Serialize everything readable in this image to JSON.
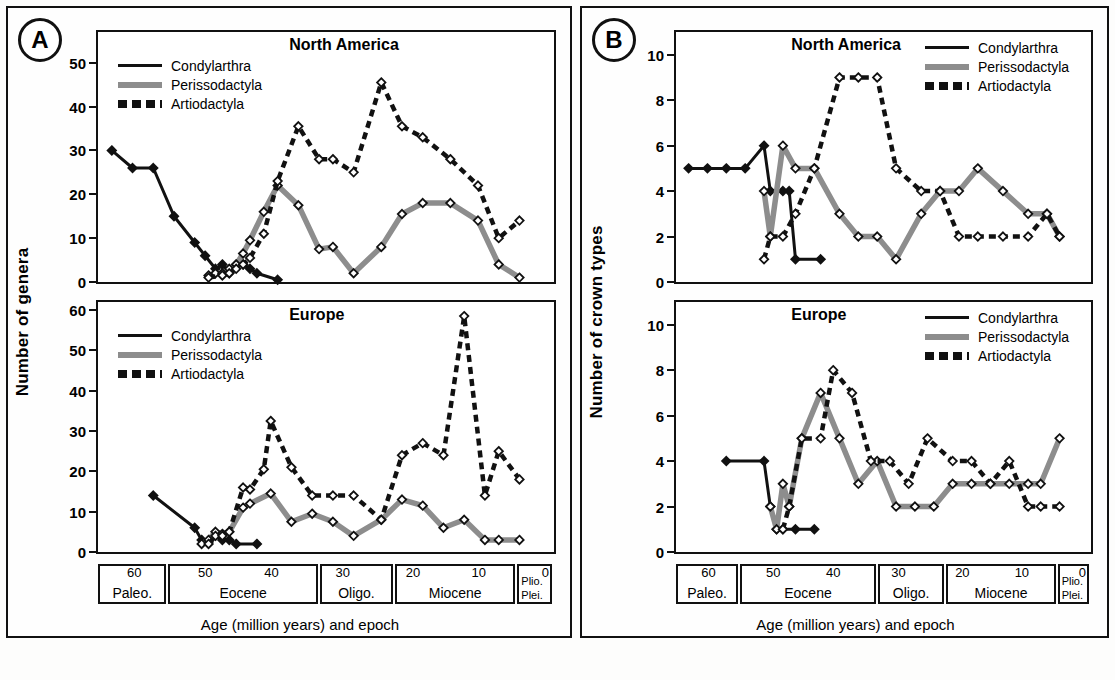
{
  "figure": {
    "panels": [
      {
        "id": "A",
        "badge": "A",
        "ylabel": "Number of genera",
        "xcaption": "Age (million years) and epoch"
      },
      {
        "id": "B",
        "badge": "B",
        "ylabel": "Number of crown types",
        "xcaption": "Age (million years) and epoch"
      }
    ],
    "epochs": [
      {
        "name": "Paleo.",
        "nums": [
          "60"
        ],
        "start": 66,
        "end": 55.8
      },
      {
        "name": "Eocene",
        "nums": [
          "50",
          "40"
        ],
        "start": 55.8,
        "end": 33.9
      },
      {
        "name": "Oligo.",
        "nums": [
          "30"
        ],
        "start": 33.9,
        "end": 23.0
      },
      {
        "name": "Miocene",
        "nums": [
          "20",
          "10"
        ],
        "start": 23.0,
        "end": 5.3
      },
      {
        "name": "Plio.",
        "name2": "Plei.",
        "nums": [
          "0"
        ],
        "start": 5.3,
        "end": 0
      }
    ],
    "legend": [
      {
        "key": "condylarthra",
        "label": "Condylarthra",
        "style": "solid",
        "color": "#111111"
      },
      {
        "key": "perissodactyla",
        "label": "Perissodactyla",
        "style": "gray",
        "color": "#8d8d8d"
      },
      {
        "key": "artiodactyla",
        "label": "Artiodactyla",
        "style": "dashed",
        "color": "#111111"
      }
    ]
  },
  "chart_data": [
    {
      "id": "A-north-america",
      "type": "line",
      "title": "North America",
      "xlabel": "Age (million years) and epoch",
      "ylabel": "Number of genera",
      "xlim": [
        66,
        0
      ],
      "ylim": [
        0,
        57
      ],
      "yticks": [
        0,
        10,
        20,
        30,
        40,
        50
      ],
      "grid": false,
      "legend_position": "top-left",
      "series": [
        {
          "name": "Condylarthra",
          "style": "solid",
          "color": "#111111",
          "marker": "filled-diamond",
          "points": [
            [
              64,
              30
            ],
            [
              61,
              26
            ],
            [
              58,
              26
            ],
            [
              55,
              15
            ],
            [
              52,
              9
            ],
            [
              50.5,
              6
            ],
            [
              49,
              3
            ],
            [
              48,
              4
            ],
            [
              47,
              2
            ],
            [
              46,
              4
            ],
            [
              45,
              4
            ],
            [
              44,
              3
            ],
            [
              43,
              2
            ],
            [
              40,
              0.5
            ]
          ]
        },
        {
          "name": "Perissodactyla",
          "style": "gray",
          "color": "#8d8d8d",
          "marker": "open-diamond",
          "points": [
            [
              50,
              1.5
            ],
            [
              49,
              2
            ],
            [
              48,
              2
            ],
            [
              47,
              3
            ],
            [
              46,
              4
            ],
            [
              45,
              6.5
            ],
            [
              44,
              9.5
            ],
            [
              42,
              16
            ],
            [
              40,
              22
            ],
            [
              37,
              17.5
            ],
            [
              34,
              7.5
            ],
            [
              32,
              8
            ],
            [
              29,
              2
            ],
            [
              25,
              8
            ],
            [
              22,
              15.5
            ],
            [
              19,
              18
            ],
            [
              15,
              18
            ],
            [
              11,
              14
            ],
            [
              8,
              4
            ],
            [
              5,
              1
            ]
          ]
        },
        {
          "name": "Artiodactyla",
          "style": "dashed",
          "color": "#111111",
          "marker": "open-diamond",
          "points": [
            [
              50,
              1
            ],
            [
              48,
              1.5
            ],
            [
              47,
              2
            ],
            [
              46,
              3
            ],
            [
              45,
              4
            ],
            [
              44,
              5.5
            ],
            [
              42,
              11
            ],
            [
              40,
              23
            ],
            [
              37,
              35.5
            ],
            [
              34,
              28
            ],
            [
              32,
              28
            ],
            [
              29,
              25
            ],
            [
              25,
              45.5
            ],
            [
              22,
              35.5
            ],
            [
              19,
              33
            ],
            [
              15,
              28
            ],
            [
              11,
              22
            ],
            [
              8,
              10
            ],
            [
              5,
              14
            ]
          ]
        }
      ]
    },
    {
      "id": "A-europe",
      "type": "line",
      "title": "Europe",
      "xlabel": "Age (million years) and epoch",
      "ylabel": "Number of genera",
      "xlim": [
        66,
        0
      ],
      "ylim": [
        0,
        62
      ],
      "yticks": [
        0,
        10,
        20,
        30,
        40,
        50,
        60
      ],
      "grid": false,
      "legend_position": "top-left",
      "series": [
        {
          "name": "Condylarthra",
          "style": "solid",
          "color": "#111111",
          "marker": "filled-diamond",
          "points": [
            [
              58,
              14
            ],
            [
              52,
              6
            ],
            [
              51,
              3
            ],
            [
              50,
              2.5
            ],
            [
              49,
              4
            ],
            [
              48,
              3
            ],
            [
              47,
              3
            ],
            [
              46,
              2
            ],
            [
              43,
              2
            ]
          ]
        },
        {
          "name": "Perissodactyla",
          "style": "gray",
          "color": "#8d8d8d",
          "marker": "open-diamond",
          "points": [
            [
              51,
              2
            ],
            [
              50,
              3
            ],
            [
              49,
              5
            ],
            [
              48,
              4.5
            ],
            [
              47,
              5
            ],
            [
              45,
              11
            ],
            [
              44,
              12
            ],
            [
              41,
              14.5
            ],
            [
              38,
              7.5
            ],
            [
              35,
              9.5
            ],
            [
              32,
              7.5
            ],
            [
              29,
              4
            ],
            [
              25,
              8
            ],
            [
              22,
              13
            ],
            [
              19,
              11.5
            ],
            [
              16,
              6
            ],
            [
              13,
              8
            ],
            [
              10,
              3
            ],
            [
              8,
              3
            ],
            [
              5,
              3
            ]
          ]
        },
        {
          "name": "Artiodactyla",
          "style": "dashed",
          "color": "#111111",
          "marker": "open-diamond",
          "points": [
            [
              50,
              2
            ],
            [
              49,
              4
            ],
            [
              48,
              4
            ],
            [
              47,
              5
            ],
            [
              45,
              16
            ],
            [
              44,
              15.5
            ],
            [
              42,
              20.5
            ],
            [
              41,
              32.5
            ],
            [
              38,
              21
            ],
            [
              35,
              14
            ],
            [
              32,
              14
            ],
            [
              29,
              14
            ],
            [
              25,
              8
            ],
            [
              22,
              24
            ],
            [
              19,
              27
            ],
            [
              16,
              24
            ],
            [
              13,
              58.5
            ],
            [
              10,
              14
            ],
            [
              8,
              25
            ],
            [
              5,
              18
            ]
          ]
        }
      ]
    },
    {
      "id": "B-north-america",
      "type": "line",
      "title": "North America",
      "xlabel": "Age (million years) and epoch",
      "ylabel": "Number of crown types",
      "xlim": [
        66,
        0
      ],
      "ylim": [
        0,
        11
      ],
      "yticks": [
        0,
        2,
        4,
        6,
        8,
        10
      ],
      "grid": false,
      "legend_position": "top-right",
      "series": [
        {
          "name": "Condylarthra",
          "style": "solid",
          "color": "#111111",
          "marker": "filled-diamond",
          "points": [
            [
              64,
              5
            ],
            [
              61,
              5
            ],
            [
              58,
              5
            ],
            [
              55,
              5
            ],
            [
              52,
              6
            ],
            [
              51,
              4
            ],
            [
              49,
              4
            ],
            [
              48,
              4
            ],
            [
              47,
              1
            ],
            [
              43,
              1
            ]
          ]
        },
        {
          "name": "Perissodactyla",
          "style": "gray",
          "color": "#8d8d8d",
          "marker": "open-diamond",
          "points": [
            [
              52,
              4
            ],
            [
              51,
              2
            ],
            [
              49,
              6
            ],
            [
              47,
              5
            ],
            [
              44,
              5
            ],
            [
              40,
              3
            ],
            [
              37,
              2
            ],
            [
              34,
              2
            ],
            [
              31,
              1
            ],
            [
              27,
              3
            ],
            [
              24,
              4
            ],
            [
              21,
              4
            ],
            [
              18,
              5
            ],
            [
              14,
              4
            ],
            [
              10,
              3
            ],
            [
              7,
              3
            ],
            [
              5,
              2
            ]
          ]
        },
        {
          "name": "Artiodactyla",
          "style": "dashed",
          "color": "#111111",
          "marker": "open-diamond",
          "points": [
            [
              52,
              1
            ],
            [
              51,
              2
            ],
            [
              49,
              2
            ],
            [
              47,
              3
            ],
            [
              44,
              5
            ],
            [
              40,
              9
            ],
            [
              37,
              9
            ],
            [
              34,
              9
            ],
            [
              31,
              5
            ],
            [
              27,
              4
            ],
            [
              24,
              4
            ],
            [
              21,
              2
            ],
            [
              18,
              2
            ],
            [
              14,
              2
            ],
            [
              10,
              2
            ],
            [
              7,
              3
            ],
            [
              5,
              2
            ]
          ]
        }
      ]
    },
    {
      "id": "B-europe",
      "type": "line",
      "title": "Europe",
      "xlabel": "Age (million years) and epoch",
      "ylabel": "Number of crown types",
      "xlim": [
        66,
        0
      ],
      "ylim": [
        0,
        11
      ],
      "yticks": [
        0,
        2,
        4,
        6,
        8,
        10
      ],
      "grid": false,
      "legend_position": "top-right",
      "series": [
        {
          "name": "Condylarthra",
          "style": "solid",
          "color": "#111111",
          "marker": "filled-diamond",
          "points": [
            [
              58,
              4
            ],
            [
              52,
              4
            ],
            [
              51,
              2
            ],
            [
              50,
              1
            ],
            [
              49,
              1
            ],
            [
              47,
              1
            ],
            [
              44,
              1
            ]
          ]
        },
        {
          "name": "Perissodactyla",
          "style": "gray",
          "color": "#8d8d8d",
          "marker": "open-diamond",
          "points": [
            [
              51,
              2
            ],
            [
              50,
              1
            ],
            [
              49,
              3
            ],
            [
              48,
              2
            ],
            [
              46,
              5
            ],
            [
              43,
              7
            ],
            [
              40,
              5
            ],
            [
              37,
              3
            ],
            [
              34,
              4
            ],
            [
              31,
              2
            ],
            [
              28,
              2
            ],
            [
              25,
              2
            ],
            [
              22,
              3
            ],
            [
              19,
              3
            ],
            [
              16,
              3
            ],
            [
              13,
              3
            ],
            [
              10,
              3
            ],
            [
              8,
              3
            ],
            [
              5,
              5
            ]
          ]
        },
        {
          "name": "Artiodactyla",
          "style": "dashed",
          "color": "#111111",
          "marker": "open-diamond",
          "points": [
            [
              49,
              1
            ],
            [
              48,
              2
            ],
            [
              46,
              5
            ],
            [
              43,
              5
            ],
            [
              41,
              8
            ],
            [
              38,
              7
            ],
            [
              35,
              4
            ],
            [
              32,
              4
            ],
            [
              29,
              3
            ],
            [
              26,
              5
            ],
            [
              22,
              4
            ],
            [
              19,
              4
            ],
            [
              16,
              3
            ],
            [
              13,
              4
            ],
            [
              10,
              2
            ],
            [
              8,
              2
            ],
            [
              5,
              2
            ]
          ]
        }
      ]
    }
  ]
}
